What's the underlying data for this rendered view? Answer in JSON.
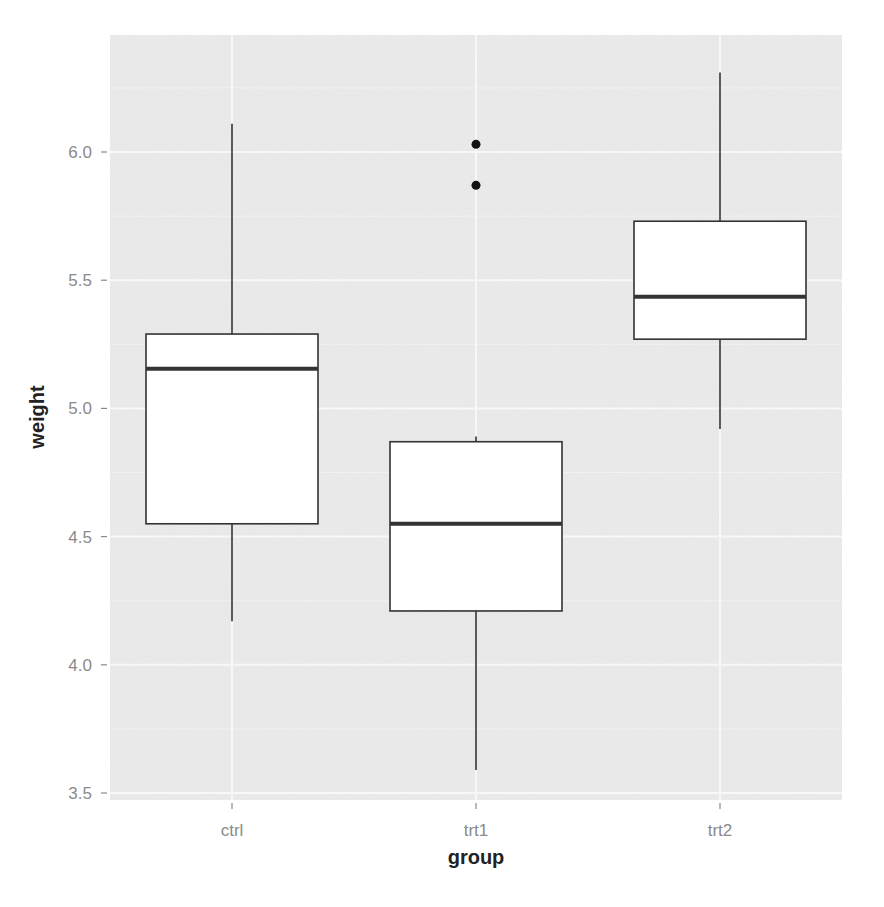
{
  "chart_data": {
    "type": "boxplot",
    "title": "",
    "xlabel": "group",
    "ylabel": "weight",
    "categories": [
      "ctrl",
      "trt1",
      "trt2"
    ],
    "ylim": [
      3.45,
      6.45
    ],
    "yticks": [
      3.5,
      4.0,
      4.5,
      5.0,
      5.5,
      6.0
    ],
    "ytick_labels": [
      "3.5",
      "4.0",
      "4.5",
      "5.0",
      "5.5",
      "6.0"
    ],
    "grid": true,
    "legend": "none",
    "series": [
      {
        "name": "ctrl",
        "whisker_low": 4.17,
        "q1": 4.55,
        "median": 5.155,
        "q3": 5.29,
        "whisker_high": 6.11,
        "outliers": []
      },
      {
        "name": "trt1",
        "whisker_low": 3.59,
        "q1": 4.21,
        "median": 4.55,
        "q3": 4.87,
        "whisker_high": 4.89,
        "outliers": [
          5.87,
          6.03
        ]
      },
      {
        "name": "trt2",
        "whisker_low": 4.92,
        "q1": 5.27,
        "median": 5.435,
        "q3": 5.73,
        "whisker_high": 6.31,
        "outliers": []
      }
    ]
  },
  "style": {
    "panel_bg": "#ebebeb",
    "grid_major": "#f7f7f7",
    "grid_minor": "#f1f1f1",
    "box_fill": "#ffffff",
    "box_stroke": "#333333",
    "median_stroke": "#333333",
    "tick_color": "#8a8a8a",
    "outlier_color": "#111111"
  }
}
